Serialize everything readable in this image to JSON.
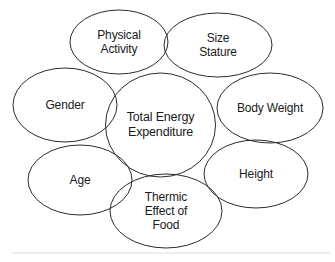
{
  "diagram": {
    "type": "venn-cluster",
    "center": {
      "name": "total-energy-expenditure",
      "label": "Total Energy\nExpenditure",
      "cx": 160.5,
      "cy": 125,
      "rx": 55,
      "ry": 52
    },
    "satellites": [
      {
        "name": "physical-activity",
        "label": "Physical\nActivity",
        "cx": 119,
        "cy": 42,
        "rx": 49,
        "ry": 32
      },
      {
        "name": "size-stature",
        "label": "Size\nStature",
        "cx": 218,
        "cy": 45,
        "rx": 54,
        "ry": 32
      },
      {
        "name": "gender",
        "label": "Gender",
        "cx": 65,
        "cy": 105,
        "rx": 52,
        "ry": 37
      },
      {
        "name": "body-weight",
        "label": "Body Weight",
        "cx": 270,
        "cy": 108,
        "rx": 53,
        "ry": 35
      },
      {
        "name": "age",
        "label": "Age",
        "cx": 80,
        "cy": 180,
        "rx": 52,
        "ry": 35
      },
      {
        "name": "height",
        "label": "Height",
        "cx": 256,
        "cy": 174,
        "rx": 52,
        "ry": 34
      },
      {
        "name": "thermic-effect-of-food",
        "label": "Thermic\nEffect of\nFood",
        "cx": 166,
        "cy": 211,
        "rx": 56,
        "ry": 37
      }
    ],
    "style": {
      "stroke_color": "#2b2b2b",
      "fill_color": "#ffffff",
      "text_color": "#1a1a1a",
      "background_color": "#ffffff",
      "rule_color": "#ededed"
    }
  }
}
